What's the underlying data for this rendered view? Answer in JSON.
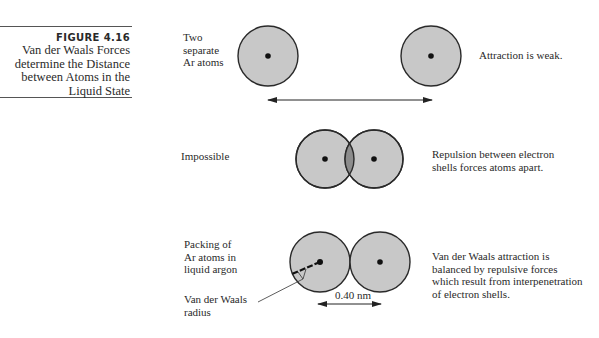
{
  "figure": {
    "number": "FIGURE 4.16",
    "title_lines": [
      "Van der Waals Forces",
      "determine the Distance",
      "between Atoms in the",
      "Liquid State"
    ]
  },
  "panels": {
    "separate": {
      "left_label_lines": [
        "Two",
        "separate",
        "Ar atoms"
      ],
      "right_label": "Attraction is weak."
    },
    "overlap": {
      "left_label": "Impossible",
      "right_label_lines": [
        "Repulsion between electron",
        "shells forces atoms apart."
      ]
    },
    "packing": {
      "left_label_lines": [
        "Packing of",
        "Ar atoms in",
        "liquid argon"
      ],
      "radius_label_lines": [
        "Van der Waals",
        "radius"
      ],
      "distance_label": "0.40 nm",
      "right_label_lines": [
        "Van der Waals attraction is",
        "balanced by repulsive forces",
        "which result from interpenetration",
        "of electron shells."
      ]
    }
  },
  "colors": {
    "atom_fill": "#c8c8c8",
    "overlap_fill": "#8c8c8c",
    "outline": "#2a2a2a",
    "nucleus": "#111111"
  }
}
